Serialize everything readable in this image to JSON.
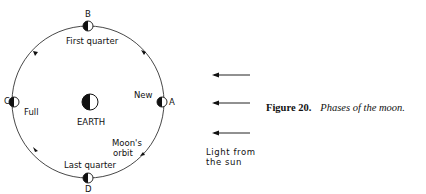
{
  "figure": {
    "number_label": "Figure 20.",
    "title": "Phases of the moon."
  },
  "orbit": {
    "label_line1": "Moon's",
    "label_line2": "orbit",
    "direction": "counterclockwise"
  },
  "earth": {
    "label": "EARTH"
  },
  "positions": [
    {
      "letter": "A",
      "phase": "New"
    },
    {
      "letter": "B",
      "phase": "First quarter"
    },
    {
      "letter": "C",
      "phase": "Full"
    },
    {
      "letter": "D",
      "phase": "Last quarter"
    }
  ],
  "sunlight": {
    "label_line1": "Light from",
    "label_line2": "the sun",
    "arrow_count": 3
  }
}
